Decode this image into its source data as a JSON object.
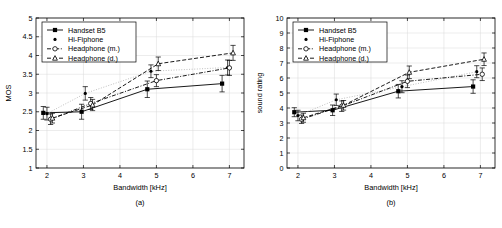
{
  "figure": {
    "panels": [
      "a",
      "b"
    ]
  },
  "legend": {
    "entries": [
      {
        "label": "Handset B5",
        "marker": "filled-square",
        "line": "solid"
      },
      {
        "label": "Hi-Fiphone",
        "marker": "dot",
        "line": "dotted"
      },
      {
        "label": "Headphone (m.)",
        "marker": "open-circle",
        "line": "dash-dot"
      },
      {
        "label": "Headphone (d.)",
        "marker": "open-triangle",
        "line": "dashed"
      }
    ]
  },
  "chart_data": [
    {
      "type": "line",
      "panel": "(a)",
      "title": "",
      "xlabel": "Bandwidth [kHz]",
      "ylabel": "MOS",
      "xlim": [
        1.7,
        7.4
      ],
      "ylim": [
        1,
        5
      ],
      "xticks": [
        2,
        3,
        4,
        5,
        6,
        7
      ],
      "yticks": [
        1,
        1.5,
        2,
        2.5,
        3,
        3.5,
        4,
        4.5,
        5
      ],
      "grid": true,
      "legend_position": "top-left",
      "series": [
        {
          "name": "Handset B5",
          "x": [
            1.9,
            2.95,
            4.75,
            6.8
          ],
          "y": [
            2.47,
            2.5,
            3.1,
            3.25
          ],
          "yerr": [
            0.17,
            0.2,
            0.22,
            0.22
          ]
        },
        {
          "name": "Hi-Fiphone",
          "x": [
            2.0,
            3.05,
            4.85,
            6.95
          ],
          "y": [
            2.45,
            2.99,
            3.58,
            3.68
          ],
          "yerr": [
            0.17,
            0.18,
            0.17,
            0.2
          ]
        },
        {
          "name": "Headphone (m.)",
          "x": [
            2.1,
            3.2,
            5.0,
            7.0
          ],
          "y": [
            2.3,
            2.72,
            3.33,
            3.67
          ],
          "yerr": [
            0.14,
            0.16,
            0.16,
            0.2
          ]
        },
        {
          "name": "Headphone (d.)",
          "x": [
            2.15,
            3.25,
            5.05,
            7.1
          ],
          "y": [
            2.33,
            2.68,
            3.78,
            4.07
          ],
          "yerr": [
            0.13,
            0.15,
            0.18,
            0.2
          ]
        }
      ]
    },
    {
      "type": "line",
      "panel": "(b)",
      "title": "",
      "xlabel": "Bandwidth [kHz]",
      "ylabel": "sound rating",
      "xlim": [
        1.7,
        7.4
      ],
      "ylim": [
        0,
        10
      ],
      "xticks": [
        2,
        3,
        4,
        5,
        6,
        7
      ],
      "yticks": [
        0,
        1,
        2,
        3,
        4,
        5,
        6,
        7,
        8,
        9,
        10
      ],
      "grid": true,
      "legend_position": "top-left",
      "series": [
        {
          "name": "Handset B5",
          "x": [
            1.9,
            2.95,
            4.75,
            6.8
          ],
          "y": [
            3.72,
            3.85,
            5.12,
            5.43
          ],
          "yerr": [
            0.3,
            0.35,
            0.45,
            0.45
          ]
        },
        {
          "name": "Hi-Fiphone",
          "x": [
            2.0,
            3.05,
            4.85,
            6.9
          ],
          "y": [
            3.5,
            4.55,
            5.42,
            6.42
          ],
          "yerr": [
            0.35,
            0.38,
            0.4,
            0.4
          ]
        },
        {
          "name": "Headphone (m.)",
          "x": [
            2.1,
            3.2,
            5.0,
            7.05
          ],
          "y": [
            3.25,
            4.12,
            5.78,
            6.25
          ],
          "yerr": [
            0.28,
            0.35,
            0.42,
            0.42
          ]
        },
        {
          "name": "Headphone (d.)",
          "x": [
            2.15,
            3.25,
            5.05,
            7.1
          ],
          "y": [
            3.35,
            4.18,
            6.38,
            7.25
          ],
          "yerr": [
            0.3,
            0.32,
            0.42,
            0.42
          ]
        }
      ]
    }
  ]
}
